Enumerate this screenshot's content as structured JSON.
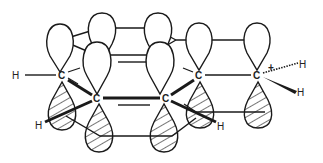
{
  "diagram": {
    "colors": {
      "stroke": "#1a1a1a",
      "background": "#ffffff"
    },
    "atoms": [
      {
        "id": "C1",
        "label": "C",
        "x": 62,
        "y": 75
      },
      {
        "id": "C2",
        "label": "C",
        "x": 97,
        "y": 98
      },
      {
        "id": "C3",
        "label": "C",
        "x": 166,
        "y": 98
      },
      {
        "id": "C4",
        "label": "C",
        "x": 199,
        "y": 75
      },
      {
        "id": "C5",
        "label": "C",
        "x": 257,
        "y": 75
      }
    ],
    "hydrogens": [
      {
        "id": "H1",
        "label": "H",
        "x": 16,
        "y": 75
      },
      {
        "id": "H2",
        "label": "H",
        "x": 38,
        "y": 125
      },
      {
        "id": "H3",
        "label": "H",
        "x": 220,
        "y": 126
      },
      {
        "id": "H4",
        "label": "H",
        "x": 303,
        "y": 64
      },
      {
        "id": "H5",
        "label": "H",
        "x": 301,
        "y": 92
      }
    ],
    "charge": {
      "label": "+",
      "x": 272,
      "y": 70
    },
    "legend": {
      "open_lobe": "upper lobe (unshaded)",
      "hatched_lobe": "lower lobe (hatched)"
    }
  }
}
